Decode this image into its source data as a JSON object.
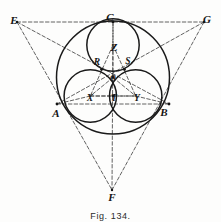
{
  "figure": {
    "caption": "Fig. 134.",
    "title": "Fig. 134",
    "colors": {
      "ink": "#141414",
      "stroke_heavy": "#1a1a1a",
      "stroke_light": "#4a4a4a",
      "dash": "#3a3a3a",
      "paper": "#fdfdfc"
    },
    "points": [
      {
        "id": "E",
        "label": "E",
        "x": 14,
        "y": 20,
        "size": "normal"
      },
      {
        "id": "C",
        "label": "C",
        "x": 110,
        "y": 17,
        "size": "normal"
      },
      {
        "id": "G",
        "label": "G",
        "x": 207,
        "y": 19,
        "size": "normal"
      },
      {
        "id": "Z",
        "label": "Z",
        "x": 114,
        "y": 47,
        "size": "normal"
      },
      {
        "id": "R",
        "label": "R",
        "x": 97,
        "y": 63,
        "size": "small"
      },
      {
        "id": "S",
        "label": "S",
        "x": 128,
        "y": 62,
        "size": "small"
      },
      {
        "id": "O",
        "label": "O",
        "x": 113,
        "y": 79,
        "size": "tiny"
      },
      {
        "id": "X",
        "label": "X",
        "x": 90,
        "y": 99,
        "size": "small"
      },
      {
        "id": "T",
        "label": "T",
        "x": 114,
        "y": 99,
        "size": "small"
      },
      {
        "id": "Y",
        "label": "Y",
        "x": 137,
        "y": 99,
        "size": "small"
      },
      {
        "id": "A",
        "label": "A",
        "x": 56,
        "y": 113,
        "size": "normal"
      },
      {
        "id": "B",
        "label": "B",
        "x": 164,
        "y": 112,
        "size": "normal"
      },
      {
        "id": "F",
        "label": "F",
        "x": 112,
        "y": 197,
        "size": "normal"
      }
    ],
    "circles": [
      {
        "id": "circumscribed-circle",
        "name": "large-circle",
        "cx": 113,
        "cy": 77.5,
        "r": 56.5,
        "weight": 1.5
      },
      {
        "id": "inner-circle-top",
        "name": "circle-centre-Z",
        "cx": 113,
        "cy": 45.0,
        "r": 26.2,
        "weight": 1.5
      },
      {
        "id": "inner-circle-left",
        "name": "circle-centre-X",
        "cx": 90.3,
        "cy": 96.0,
        "r": 26.2,
        "weight": 1.5
      },
      {
        "id": "inner-circle-right",
        "name": "circle-centre-Y",
        "cx": 135.7,
        "cy": 96.0,
        "r": 26.2,
        "weight": 1.5
      }
    ],
    "dashed_segments": [
      {
        "name": "line-E-G",
        "x1": 17,
        "y1": 22,
        "x2": 204,
        "y2": 22
      },
      {
        "name": "line-E-F",
        "x1": 17,
        "y1": 22,
        "x2": 112,
        "y2": 190
      },
      {
        "name": "line-G-F",
        "x1": 204,
        "y1": 22,
        "x2": 112,
        "y2": 190
      },
      {
        "name": "line-E-B",
        "x1": 17,
        "y1": 22,
        "x2": 169,
        "y2": 104
      },
      {
        "name": "line-G-A",
        "x1": 204,
        "y1": 22,
        "x2": 57,
        "y2": 104
      },
      {
        "name": "line-C-F",
        "x1": 113,
        "y1": 22,
        "x2": 112,
        "y2": 190
      },
      {
        "name": "line-A-B",
        "x1": 57,
        "y1": 104,
        "x2": 169,
        "y2": 104
      },
      {
        "name": "line-O-Z",
        "x1": 113,
        "y1": 77.5,
        "x2": 113,
        "y2": 45
      },
      {
        "name": "line-O-X",
        "x1": 113,
        "y1": 77.5,
        "x2": 90.3,
        "y2": 96
      },
      {
        "name": "line-O-Y",
        "x1": 113,
        "y1": 77.5,
        "x2": 135.7,
        "y2": 96
      },
      {
        "name": "line-Z-X",
        "x1": 113,
        "y1": 45,
        "x2": 90.3,
        "y2": 96
      },
      {
        "name": "line-Z-Y",
        "x1": 113,
        "y1": 45,
        "x2": 135.7,
        "y2": 96
      },
      {
        "name": "line-X-Y",
        "x1": 90.3,
        "y1": 96,
        "x2": 135.7,
        "y2": 96
      },
      {
        "name": "line-X-A",
        "x1": 90.3,
        "y1": 96,
        "x2": 57,
        "y2": 104
      },
      {
        "name": "line-Y-B",
        "x1": 135.7,
        "y1": 96,
        "x2": 169,
        "y2": 104
      },
      {
        "name": "line-Z-C",
        "x1": 113,
        "y1": 45,
        "x2": 113,
        "y2": 22
      },
      {
        "name": "line-X-T",
        "x1": 90.3,
        "y1": 96,
        "x2": 113,
        "y2": 96
      },
      {
        "name": "line-Y-T",
        "x1": 135.7,
        "y1": 96,
        "x2": 113,
        "y2": 96
      }
    ],
    "tangent_points": [
      {
        "name": "tangency-A",
        "x": 57,
        "y": 104
      },
      {
        "name": "tangency-B",
        "x": 169,
        "y": 104
      },
      {
        "name": "tangency-C",
        "x": 113,
        "y": 22
      },
      {
        "name": "tangency-R",
        "x": 101.5,
        "y": 69.5
      },
      {
        "name": "tangency-S",
        "x": 124.5,
        "y": 69.5
      },
      {
        "name": "tangency-T",
        "x": 113,
        "y": 96
      },
      {
        "name": "centre-O",
        "x": 113,
        "y": 77.5
      }
    ],
    "vertices": [
      {
        "name": "vertex-E",
        "x": 17,
        "y": 22
      },
      {
        "name": "vertex-G",
        "x": 204,
        "y": 22
      },
      {
        "name": "vertex-F",
        "x": 112,
        "y": 190
      }
    ],
    "caption_position": {
      "x": 110,
      "y": 211
    }
  }
}
